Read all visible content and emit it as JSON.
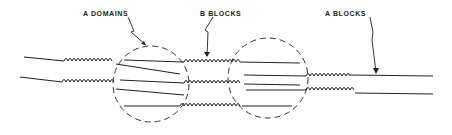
{
  "diagram": {
    "title": "",
    "labels": {
      "a_domains": "A DOMAINS",
      "b_blocks": "B BLOCKS",
      "a_blocks": "A BLOCKS"
    },
    "elements": {
      "domains": 2,
      "chain_segment_types": [
        "A block (straight line)",
        "B block (coil)"
      ]
    }
  }
}
